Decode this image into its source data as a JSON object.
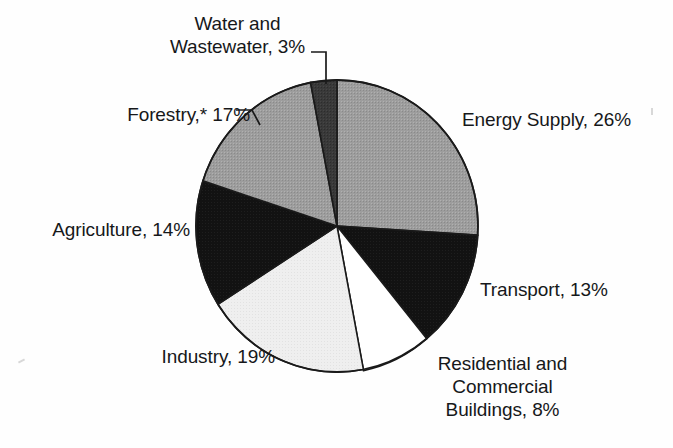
{
  "figure": {
    "background_color": "#fefefe",
    "width": 673,
    "height": 448
  },
  "chart_data": {
    "type": "pie",
    "title": "",
    "subtitle": "",
    "xlabel": "",
    "ylabel": "",
    "legend_position": "none",
    "grid": false,
    "units": "percent",
    "total": 100,
    "start_angle_deg": 0,
    "direction": "clockwise",
    "footnote_marker": "*",
    "categories": [
      "Energy Supply",
      "Transport",
      "Residential and Commercial Buildings",
      "Industry",
      "Agriculture",
      "Forestry",
      "Water and Wastewater"
    ],
    "values": [
      26,
      13,
      8,
      19,
      14,
      17,
      3
    ],
    "slices": [
      {
        "key": "energy",
        "name": "Energy Supply",
        "value": 26,
        "value_text": "26%",
        "label": "Energy Supply, 26%",
        "fill": "#9a9a9a",
        "start_deg": 0.0,
        "end_deg": 93.6
      },
      {
        "key": "transport",
        "name": "Transport",
        "value": 13,
        "value_text": "13%",
        "label": "Transport, 13%",
        "fill": "#171717",
        "start_deg": 93.6,
        "end_deg": 140.4
      },
      {
        "key": "residential",
        "name": "Residential and Commercial Buildings",
        "value": 8,
        "value_text": "8%",
        "label": "Residential and Commercial Buildings, 8%",
        "label_lines": [
          "Residential and",
          "Commercial",
          "Buildings, 8%"
        ],
        "fill": "#ffffff",
        "start_deg": 140.4,
        "end_deg": 169.2
      },
      {
        "key": "industry",
        "name": "Industry",
        "value": 19,
        "value_text": "19%",
        "label": "Industry, 19%",
        "fill": "#ededed",
        "start_deg": 169.2,
        "end_deg": 237.6
      },
      {
        "key": "agriculture",
        "name": "Agriculture",
        "value": 14,
        "value_text": "14%",
        "label": "Agriculture, 14%",
        "fill": "#0d0d0d",
        "start_deg": 237.6,
        "end_deg": 288.0
      },
      {
        "key": "forestry",
        "name": "Forestry",
        "value": 17,
        "value_text": "17%",
        "label": "Forestry,* 17%",
        "fill": "#9a9a9a",
        "start_deg": 288.0,
        "end_deg": 349.2
      },
      {
        "key": "water",
        "name": "Water and Wastewater",
        "value": 3,
        "value_text": "3%",
        "label": "Water and Wastewater, 3%",
        "label_lines": [
          "Water and",
          "Wastewater, 3%"
        ],
        "fill": "#3a3a3a",
        "start_deg": 349.2,
        "end_deg": 360.0
      }
    ]
  },
  "labels": {
    "water_line1": "Water and",
    "water_line2": "Wastewater, 3%",
    "forestry": "Forestry,* 17%",
    "agriculture": "Agriculture, 14%",
    "industry": "Industry, 19%",
    "residential_line1": "Residential and",
    "residential_line2": "Commercial",
    "residential_line3": "Buildings, 8%",
    "transport": "Transport, 13%",
    "energy": "Energy Supply, 26%"
  },
  "colors": {
    "ink": "#16181a",
    "outline": "#1a1a1a",
    "gray_fill": "#9a9a9a",
    "dark_fill": "#3a3a3a",
    "black_fill": "#0d0d0d",
    "white_fill": "#ffffff",
    "light_fill": "#ededed",
    "page": "#fefefe"
  }
}
